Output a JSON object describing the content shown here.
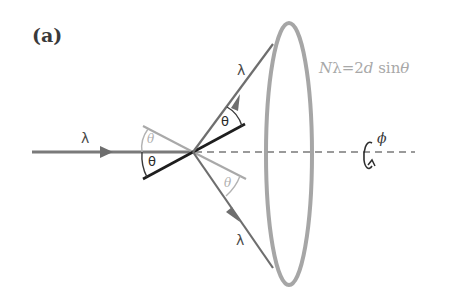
{
  "figure": {
    "panel_label": "(a)",
    "equation": {
      "N": "N",
      "lambda": "λ",
      "rest": "=2",
      "d": "d",
      "sin": " sin",
      "theta": "θ"
    },
    "labels": {
      "incident_lambda": "λ",
      "upper_lambda": "λ",
      "lower_lambda": "λ",
      "theta_incident": "θ",
      "theta_upper": "θ",
      "theta_ghost_left": "θ",
      "theta_ghost_right": "θ",
      "phi": "ϕ"
    },
    "colors": {
      "beam": "#6e6e6e",
      "plane": "#1e1e1e",
      "ghost_plane": "#a9a9a9",
      "cone_ring": "#a6a6a6",
      "axis_dashed": "#9a9a9a",
      "equation": "#a8a8a8"
    }
  }
}
